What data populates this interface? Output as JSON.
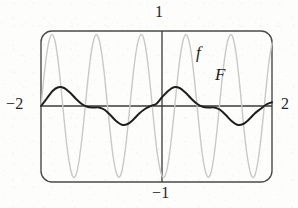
{
  "figure": {
    "title": "",
    "background_color": "#fdfdfc"
  },
  "labels": {
    "top": "1",
    "left": "−2",
    "right": "2",
    "bottom": "−1",
    "curve_f": "f",
    "curve_F": "F"
  },
  "colors": {
    "frame": "#4a4a4a",
    "axis": "#3a3a3a",
    "curve_f": "#c9c9c9",
    "curve_F": "#1f1f1f",
    "text": "#262626"
  },
  "chart_data": {
    "type": "line",
    "title": "",
    "xlabel": "",
    "ylabel": "",
    "xlim": [
      -2,
      2
    ],
    "ylim": [
      -1,
      1
    ],
    "grid": false,
    "legend": "inline-annotations",
    "xticks": [
      -2,
      2
    ],
    "xticklabels": [
      "−2",
      "2"
    ],
    "yticks": [
      -1,
      1
    ],
    "yticklabels": [
      "−1",
      "1"
    ],
    "annotations": [
      {
        "text": "f",
        "x": 0.45,
        "y": 0.72
      },
      {
        "text": "F",
        "x": 0.72,
        "y": 0.45
      }
    ],
    "series": [
      {
        "name": "f",
        "color": "#c9c9c9",
        "width": 1.4,
        "description": "rapidly oscillating function, amplitude ~0.85, about 4.25 periods over [-2,2]",
        "x": [
          -2.0,
          -1.95,
          -1.9,
          -1.85,
          -1.8,
          -1.75,
          -1.7,
          -1.65,
          -1.6,
          -1.55,
          -1.5,
          -1.45,
          -1.4,
          -1.35,
          -1.3,
          -1.25,
          -1.2,
          -1.15,
          -1.1,
          -1.05,
          -1.0,
          -0.95,
          -0.9,
          -0.85,
          -0.8,
          -0.75,
          -0.7,
          -0.65,
          -0.6,
          -0.55,
          -0.5,
          -0.45,
          -0.4,
          -0.35,
          -0.3,
          -0.25,
          -0.2,
          -0.15,
          -0.1,
          -0.05,
          0.0,
          0.05,
          0.1,
          0.15,
          0.2,
          0.25,
          0.3,
          0.35,
          0.4,
          0.45,
          0.5,
          0.55,
          0.6,
          0.65,
          0.7,
          0.75,
          0.8,
          0.85,
          0.9,
          0.95,
          1.0,
          1.05,
          1.1,
          1.15,
          1.2,
          1.25,
          1.3,
          1.35,
          1.4,
          1.45,
          1.5,
          1.55,
          1.6,
          1.65,
          1.7,
          1.75,
          1.8,
          1.85,
          1.9,
          1.95,
          2.0
        ],
        "y": [
          0.0,
          0.38,
          0.7,
          0.9,
          0.95,
          0.84,
          0.58,
          0.22,
          -0.18,
          -0.54,
          -0.8,
          -0.94,
          -0.93,
          -0.77,
          -0.49,
          -0.13,
          0.26,
          0.6,
          0.84,
          0.95,
          0.9,
          0.71,
          0.4,
          0.02,
          -0.36,
          -0.68,
          -0.88,
          -0.95,
          -0.87,
          -0.64,
          -0.31,
          0.08,
          0.45,
          0.74,
          0.91,
          0.95,
          0.83,
          0.57,
          0.21,
          -0.19,
          -0.55,
          -0.8,
          -0.94,
          -0.93,
          -0.77,
          -0.49,
          -0.13,
          0.26,
          0.6,
          0.84,
          0.95,
          0.9,
          0.71,
          0.4,
          0.02,
          -0.36,
          -0.68,
          -0.88,
          -0.95,
          -0.87,
          -0.64,
          -0.31,
          0.08,
          0.45,
          0.74,
          0.91,
          0.95,
          0.83,
          0.57,
          0.21,
          -0.19,
          -0.55,
          -0.8,
          -0.94,
          -0.93,
          -0.77,
          -0.49,
          -0.13,
          0.26,
          0.6,
          0.84
        ]
      },
      {
        "name": "F",
        "color": "#1f1f1f",
        "width": 2.0,
        "description": "antiderivative of f, slow wave, amplitude ~0.25, about 2 periods over [-2,2]",
        "x": [
          -2.0,
          -1.9,
          -1.8,
          -1.7,
          -1.6,
          -1.5,
          -1.4,
          -1.3,
          -1.2,
          -1.1,
          -1.0,
          -0.9,
          -0.8,
          -0.7,
          -0.6,
          -0.5,
          -0.4,
          -0.3,
          -0.2,
          -0.1,
          0.0,
          0.1,
          0.2,
          0.3,
          0.4,
          0.5,
          0.6,
          0.7,
          0.8,
          0.9,
          1.0,
          1.1,
          1.2,
          1.3,
          1.4,
          1.5,
          1.6,
          1.7,
          1.8,
          1.9,
          2.0
        ],
        "y": [
          0.0,
          0.1,
          0.2,
          0.25,
          0.24,
          0.18,
          0.1,
          0.03,
          -0.01,
          -0.02,
          -0.02,
          -0.05,
          -0.12,
          -0.2,
          -0.25,
          -0.24,
          -0.18,
          -0.1,
          -0.04,
          0.0,
          0.03,
          0.12,
          0.2,
          0.25,
          0.24,
          0.18,
          0.1,
          0.03,
          -0.01,
          -0.02,
          -0.02,
          -0.05,
          -0.12,
          -0.2,
          -0.25,
          -0.24,
          -0.18,
          -0.1,
          -0.04,
          0.02,
          0.05
        ]
      }
    ]
  }
}
